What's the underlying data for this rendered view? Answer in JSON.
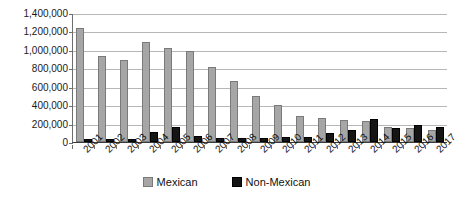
{
  "chart_data": {
    "type": "bar",
    "title": "",
    "subtitle": "",
    "xlabel": "",
    "ylabel": "",
    "grid": true,
    "legend_position": "bottom",
    "ylim": [
      0,
      1400000
    ],
    "ytick_step": 200000,
    "ytick_labels": [
      "1,400,000",
      "1,200,000",
      "1,000,000",
      "800,000",
      "600,000",
      "400,000",
      "200,000",
      "0"
    ],
    "ytick_values": [
      1400000,
      1200000,
      1000000,
      800000,
      600000,
      400000,
      200000,
      0
    ],
    "categories": [
      "2001",
      "2002",
      "2003",
      "2004",
      "2005",
      "2006",
      "2007",
      "2008",
      "2009",
      "2010",
      "2011",
      "2012",
      "2013",
      "2014",
      "2015",
      "2016",
      "2017"
    ],
    "series": [
      {
        "name": "Mexican",
        "color": "#a6a6a6",
        "values": [
          1235000,
          930000,
          885000,
          1085000,
          1020000,
          985000,
          810000,
          660000,
          495000,
          405000,
          285000,
          260000,
          235000,
          225000,
          165000,
          155000,
          130000
        ]
      },
      {
        "name": "Non-Mexican",
        "color": "#151515",
        "values": [
          30000,
          35000,
          32000,
          110000,
          165000,
          70000,
          48000,
          45000,
          40000,
          55000,
          55000,
          95000,
          130000,
          250000,
          150000,
          190000,
          160000
        ]
      }
    ]
  },
  "legend": {
    "items": [
      {
        "label": "Mexican",
        "color": "#a6a6a6"
      },
      {
        "label": "Non-Mexican",
        "color": "#151515"
      }
    ]
  }
}
